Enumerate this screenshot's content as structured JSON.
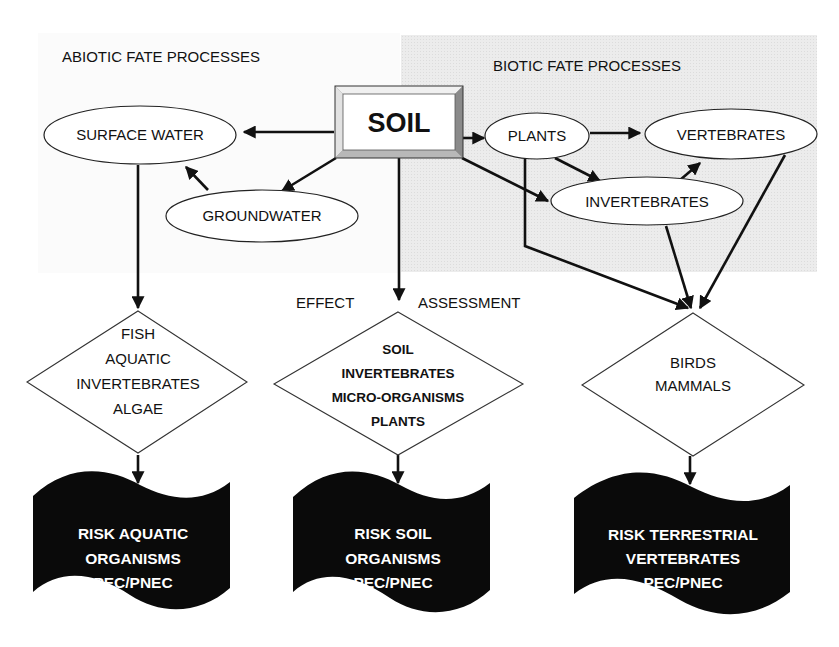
{
  "diagram": {
    "colors": {
      "biotic_region": "#ebebeb",
      "line": "#111111",
      "risk_fill": "#0a0a0a",
      "risk_text": "#ffffff",
      "bevel_light": "#e2e2e2",
      "bevel_dark": "#8a8a8a"
    },
    "headers": {
      "abiotic": "ABIOTIC FATE PROCESSES",
      "biotic": "BIOTIC FATE PROCESSES",
      "effect": "EFFECT",
      "assessment": "ASSESSMENT"
    },
    "soil": {
      "label": "SOIL"
    },
    "nodes": {
      "surface_water": "SURFACE WATER",
      "groundwater": "GROUNDWATER",
      "plants": "PLANTS",
      "vertebrates": "VERTEBRATES",
      "invertebrates": "INVERTEBRATES"
    },
    "diamonds": [
      {
        "lines": [
          "FISH",
          "AQUATIC",
          "INVERTEBRATES",
          "ALGAE"
        ]
      },
      {
        "lines": [
          "SOIL",
          "INVERTEBRATES",
          "MICRO-ORGANISMS",
          "PLANTS"
        ]
      },
      {
        "lines": [
          "BIRDS",
          "MAMMALS"
        ]
      }
    ],
    "risks": [
      {
        "lines": [
          "RISK AQUATIC",
          "ORGANISMS",
          "PEC/PNEC"
        ]
      },
      {
        "lines": [
          "RISK SOIL",
          "ORGANISMS",
          "PEC/PNEC"
        ]
      },
      {
        "lines": [
          "RISK TERRESTRIAL",
          "VERTEBRATES",
          "PEC/PNEC"
        ]
      }
    ],
    "edges": [
      {
        "from": "SOIL",
        "to": "SURFACE WATER"
      },
      {
        "from": "SOIL",
        "to": "GROUNDWATER"
      },
      {
        "from": "GROUNDWATER",
        "to": "SURFACE WATER"
      },
      {
        "from": "SOIL",
        "to": "PLANTS"
      },
      {
        "from": "SOIL",
        "to": "INVERTEBRATES"
      },
      {
        "from": "PLANTS",
        "to": "VERTEBRATES"
      },
      {
        "from": "PLANTS",
        "to": "INVERTEBRATES"
      },
      {
        "from": "INVERTEBRATES",
        "to": "VERTEBRATES"
      },
      {
        "from": "SOIL",
        "to": "SOIL INVERTEBRATES / MICRO-ORGANISMS / PLANTS"
      },
      {
        "from": "SURFACE WATER",
        "to": "FISH / AQUATIC INVERTEBRATES / ALGAE"
      },
      {
        "from": "PLANTS",
        "to": "BIRDS / MAMMALS"
      },
      {
        "from": "INVERTEBRATES",
        "to": "BIRDS / MAMMALS"
      },
      {
        "from": "VERTEBRATES",
        "to": "BIRDS / MAMMALS"
      },
      {
        "from": "FISH / AQUATIC INVERTEBRATES / ALGAE",
        "to": "RISK AQUATIC ORGANISMS PEC/PNEC"
      },
      {
        "from": "SOIL INVERTEBRATES / MICRO-ORGANISMS / PLANTS",
        "to": "RISK SOIL ORGANISMS PEC/PNEC"
      },
      {
        "from": "BIRDS / MAMMALS",
        "to": "RISK TERRESTRIAL VERTEBRATES PEC/PNEC"
      }
    ]
  }
}
